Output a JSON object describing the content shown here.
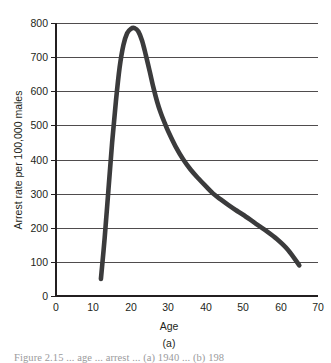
{
  "figure": {
    "subfigure_label": "(a)",
    "caption_partial": "Figure 2.15  ... age ... arrest ... (a) 1940 ... (b) 198"
  },
  "chart_data": {
    "type": "line",
    "title": "",
    "xlabel": "Age",
    "ylabel": "Arrest rate per 100,000 males",
    "xlim": [
      0,
      70
    ],
    "ylim": [
      0,
      800
    ],
    "grid": "horizontal",
    "legend": "none",
    "x_ticks": [
      0,
      10,
      20,
      30,
      40,
      50,
      60,
      70
    ],
    "x_tick_labels": [
      "0",
      "10",
      "20",
      "30",
      "40",
      "50",
      "60",
      "70"
    ],
    "y_ticks": [
      0,
      100,
      200,
      300,
      400,
      500,
      600,
      700,
      800
    ],
    "y_tick_labels": [
      "0",
      "100",
      "200",
      "300",
      "400",
      "500",
      "600",
      "700",
      "800"
    ],
    "series": [
      {
        "name": "Male arrest rate by age",
        "color": "#3b3b3c",
        "x": [
          12,
          13,
          14,
          15,
          16,
          17,
          18,
          19,
          20,
          21,
          22,
          23,
          24,
          25,
          26,
          27,
          28,
          29,
          30,
          32,
          34,
          36,
          38,
          40,
          42,
          44,
          46,
          48,
          50,
          53,
          56,
          59,
          62,
          65
        ],
        "y": [
          50,
          170,
          310,
          450,
          570,
          670,
          735,
          770,
          783,
          785,
          775,
          748,
          706,
          660,
          612,
          570,
          536,
          508,
          482,
          437,
          400,
          370,
          345,
          322,
          300,
          283,
          267,
          252,
          238,
          215,
          192,
          167,
          135,
          90
        ]
      }
    ],
    "annotations": [
      {
        "text": "peak arrest rate near age 21",
        "value": 785
      },
      {
        "text": "curve begins at age 12",
        "value": 50
      },
      {
        "text": "curve ends at age 65",
        "value": 90
      }
    ]
  }
}
